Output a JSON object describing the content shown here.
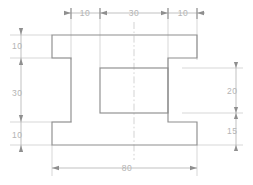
{
  "drawing": {
    "title": "H-section bracket orthographic view",
    "units": "mm",
    "colors": {
      "background": "#ffffff",
      "outline": "#8e8e8e",
      "dimension_line": "#a8a8a8",
      "extension_line": "#c6c6c6",
      "center_line": "#c0c0c0",
      "text": "#b4b4b4"
    },
    "dimensions": {
      "top": [
        {
          "label": "10",
          "value": 10
        },
        {
          "label": "30",
          "value": 30
        },
        {
          "label": "10",
          "value": 10
        }
      ],
      "left": [
        {
          "label": "10",
          "value": 10
        },
        {
          "label": "30",
          "value": 30
        },
        {
          "label": "10",
          "value": 10
        }
      ],
      "right": [
        {
          "label": "20",
          "value": 20
        },
        {
          "label": "15",
          "value": 15
        }
      ],
      "bottom": [
        {
          "label": "80",
          "value": 80
        }
      ]
    }
  }
}
